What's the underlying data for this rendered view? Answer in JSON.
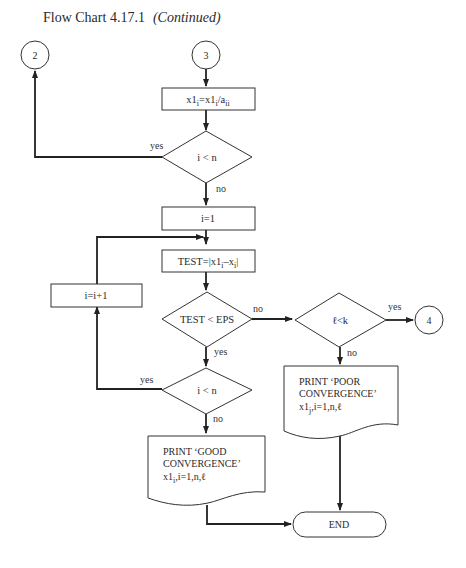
{
  "title": "Flow Chart 4.17.1",
  "title_suffix": "(Continued)",
  "connectors": {
    "c2": "2",
    "c3": "3",
    "c4": "4"
  },
  "nodes": {
    "assign_x1": "x1i=x1i/aii",
    "dec_i_lt_n_1": "i < n",
    "init_i": "i=1",
    "test": "TEST=|x1i–xi|",
    "dec_test_eps": "TEST < EPS",
    "incr_i": "i=i+1",
    "dec_i_lt_n_2": "i < n",
    "dec_l_lt_k": "ℓ<k",
    "print_good": [
      "PRINT ‘GOOD",
      "CONVERGENCE’",
      "x1i,i=1,n,ℓ"
    ],
    "print_poor": [
      "PRINT ‘POOR",
      "CONVERGENCE’",
      "x1j,i=1,n,ℓ"
    ],
    "end": "END"
  },
  "edge_labels": {
    "yes": "yes",
    "no": "no"
  }
}
